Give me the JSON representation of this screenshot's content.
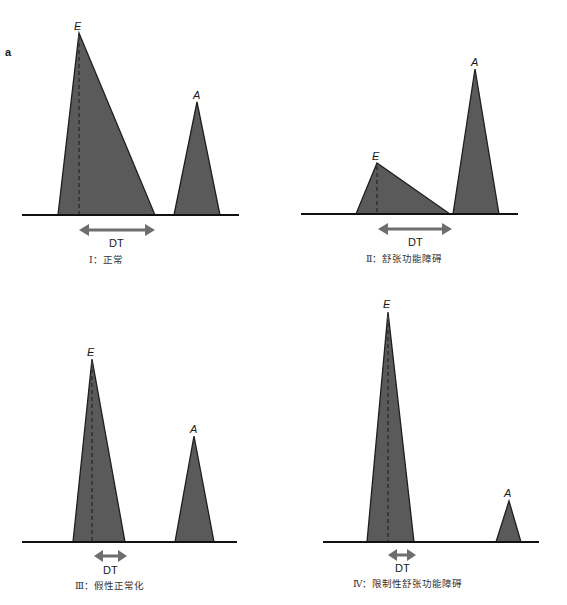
{
  "figure": {
    "panel_letter": "a",
    "peak_labels": {
      "early": "E",
      "atrial": "A"
    },
    "dt_label": "DT",
    "colors": {
      "fill": "#5a5a5a",
      "outline": "#1e1e1e",
      "arrow": "#6e6e6e",
      "baseline": "#111111"
    },
    "panels": [
      {
        "id": "I",
        "caption": "Ⅰ：正常"
      },
      {
        "id": "II",
        "caption": "Ⅱ：舒张功能障碍"
      },
      {
        "id": "III",
        "caption": "Ⅲ：假性正常化"
      },
      {
        "id": "IV",
        "caption": "Ⅳ：限制性舒张功能障碍"
      }
    ]
  }
}
